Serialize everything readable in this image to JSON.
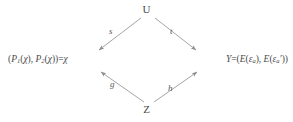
{
  "diagram": {
    "type": "commutative-diamond",
    "background_color": "#ffffff",
    "text_color": "#4a4a4a",
    "arrow_color": "#8a8a8a",
    "nodes": {
      "top": {
        "id": "U",
        "label": "U"
      },
      "bottom": {
        "id": "Z",
        "label": "Z"
      },
      "left": {
        "id": "chi-pair",
        "label": "(P1(χ), P2(χ))=χ",
        "parts": {
          "open": "(",
          "p1": "P",
          "p1_sub": "1",
          "arg1_open": "(",
          "chi1": "χ",
          "arg1_close": ")",
          "comma": ", ",
          "p2": "P",
          "p2_sub": "2",
          "arg2_open": "(",
          "chi2": "χ",
          "arg2_close": ")",
          "close": ")",
          "equals": "=",
          "result": "χ"
        }
      },
      "right": {
        "id": "Y",
        "label": "Y=(E(εa), E(εa'))",
        "parts": {
          "y": "Y",
          "equals": "=",
          "open": "(",
          "e1": "E",
          "e1_open": "(",
          "eps1": "ε",
          "eps1_sub": "a",
          "e1_close": ")",
          "comma": ", ",
          "e2": "E",
          "e2_open": "(",
          "eps2": "ε",
          "eps2_sub": "a",
          "prime": "′",
          "e2_close": ")",
          "close": ")"
        }
      }
    },
    "edges": [
      {
        "id": "s",
        "label": "s",
        "from": "U",
        "to": "chi-pair",
        "direction": "down-left"
      },
      {
        "id": "t",
        "label": "t",
        "from": "U",
        "to": "Y",
        "direction": "down-right"
      },
      {
        "id": "g",
        "label": "g",
        "from": "Z",
        "to": "chi-pair",
        "direction": "up-left"
      },
      {
        "id": "h",
        "label": "h",
        "from": "Z",
        "to": "Y",
        "direction": "up-right"
      }
    ]
  }
}
